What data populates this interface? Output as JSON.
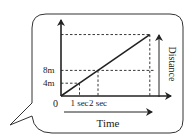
{
  "colors": {
    "stroke": "#222222",
    "bubble_stroke": "#333333",
    "background": "#ffffff"
  },
  "chart_data": {
    "type": "line",
    "title": "",
    "xlabel": "Time",
    "ylabel": "Distance",
    "x_ticks": [
      "0",
      "1 sec",
      "2 sec"
    ],
    "y_ticks": [
      "4m",
      "8m"
    ],
    "origin_label": "0",
    "series": [
      {
        "name": "distance-vs-time",
        "x": [
          0,
          1,
          2,
          4.8
        ],
        "y": [
          0,
          4,
          8,
          19.2
        ]
      }
    ],
    "guides": [
      {
        "axis": "y",
        "value": 4,
        "style": "dashed"
      },
      {
        "axis": "y",
        "value": 8,
        "style": "dashed"
      },
      {
        "axis": "x",
        "value": 1,
        "style": "dashed"
      },
      {
        "axis": "x",
        "value": 2,
        "style": "dashed"
      }
    ],
    "xlim": [
      0,
      5.5
    ],
    "ylim": [
      0,
      20
    ],
    "grid": false,
    "legend": "none"
  },
  "labels": {
    "origin": "0",
    "y4": "4m",
    "y8": "8m",
    "x1": "1 sec",
    "x2": "2 sec",
    "time": "Time",
    "distance": "Distance"
  }
}
